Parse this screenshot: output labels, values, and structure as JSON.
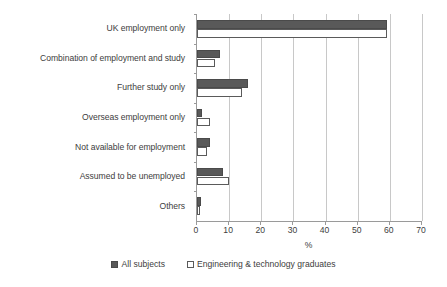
{
  "chart_data": {
    "type": "bar",
    "orientation": "horizontal",
    "title": "",
    "xlabel": "%",
    "ylabel": "",
    "xlim": [
      0,
      70
    ],
    "xticks": [
      0,
      10,
      20,
      30,
      40,
      50,
      60,
      70
    ],
    "grid": true,
    "legend_position": "bottom",
    "categories": [
      "UK employment only",
      "Combination of employment and study",
      "Further study only",
      "Overseas employment only",
      "Not available for employment",
      "Assumed to be unemployed",
      "Others"
    ],
    "series": [
      {
        "name": "All subjects",
        "color": "#595959",
        "values": [
          59.0,
          7.0,
          16.0,
          1.5,
          4.0,
          8.0,
          1.2
        ]
      },
      {
        "name": "Engineering & technology graduates",
        "color": "#ffffff",
        "values": [
          59.0,
          5.5,
          14.0,
          4.0,
          3.0,
          10.0,
          1.0
        ]
      }
    ]
  },
  "legend": {
    "items": [
      {
        "label": "All subjects",
        "swatch": "filled-dark-square"
      },
      {
        "label": "Engineering & technology graduates",
        "swatch": "open-white-square"
      }
    ]
  },
  "axis": {
    "x_title": "%",
    "tick_labels": [
      "0",
      "10",
      "20",
      "30",
      "40",
      "50",
      "60",
      "70"
    ]
  },
  "colors": {
    "series_all_subjects": "#595959",
    "series_engineering": "#ffffff",
    "series_engineering_outline": "#5a5a5a",
    "gridline": "#c8c8c8",
    "axis": "#9a9a9a",
    "text": "#404040",
    "background": "#ffffff"
  }
}
